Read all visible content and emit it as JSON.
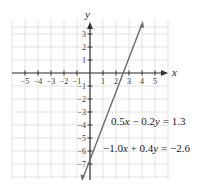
{
  "chart_data": {
    "type": "line",
    "title": "",
    "xlabel": "x",
    "ylabel": "y",
    "xlim": [
      -6,
      6
    ],
    "ylim": [
      -8,
      4
    ],
    "grid": true,
    "x_ticks": [
      "−5",
      "−4",
      "−3",
      "−2",
      "−1",
      "1",
      "2",
      "3",
      "4",
      "5"
    ],
    "y_ticks": [
      "3",
      "2",
      "1",
      "−1",
      "−2",
      "−3",
      "−4",
      "−5",
      "−6",
      "−7"
    ],
    "series": [
      {
        "name": "0.5x − 0.2y = 1.3 and −1.0x + 0.4y = −2.6 (same line)",
        "x": [
          -0.2,
          2.6,
          4.1
        ],
        "y": [
          -7.0,
          0,
          3.75
        ]
      }
    ],
    "annotations": [
      {
        "text_parts": [
          "0.5",
          "x",
          " − 0.2",
          "y",
          " = 1.3"
        ]
      },
      {
        "text_parts": [
          "−1.0",
          "x",
          " + 0.4",
          "y",
          " = −2.6"
        ]
      }
    ],
    "line_color": "#6b6b6b",
    "grid_color": "#dcdcdc"
  }
}
